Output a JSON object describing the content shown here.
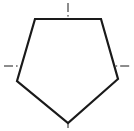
{
  "canvas": {
    "width": 134,
    "height": 131,
    "background_color": "#ffffff"
  },
  "figure": {
    "name": "pentagon",
    "label": "",
    "outline_color": "#1a1a1a",
    "outline_width": 2.2,
    "fill_color": "#ffffff",
    "vertices": [
      {
        "name": "top-left",
        "x": 35,
        "y": 19
      },
      {
        "name": "top-right",
        "x": 101,
        "y": 19
      },
      {
        "name": "right",
        "x": 118,
        "y": 79
      },
      {
        "name": "bottom",
        "x": 68,
        "y": 123
      },
      {
        "name": "left",
        "x": 17,
        "y": 81
      }
    ],
    "points_path": "35,19 101,19 118,79 68,123 17,81"
  },
  "centerlines": {
    "color": "#1a1a1a",
    "width": 1,
    "dash_pattern": "9 3 1.6 3",
    "vertical": {
      "name": "vertical-centerline",
      "x1": 68,
      "y1": 3,
      "x2": 68,
      "y2": 128
    },
    "horizontal": {
      "name": "horizontal-centerline",
      "x1": 4,
      "y1": 66,
      "x2": 130,
      "y2": 66
    }
  },
  "chart_data": {
    "type": "scatter",
    "xlabel": "",
    "ylabel": "",
    "xlim": [
      0,
      134
    ],
    "ylim": [
      0,
      131
    ],
    "grid": false,
    "legend": "none",
    "series": [
      {
        "name": "pentagon-outline",
        "x": [
          35,
          101,
          118,
          68,
          17,
          35
        ],
        "y": [
          19,
          19,
          79,
          123,
          81,
          19
        ]
      },
      {
        "name": "vertical-centerline",
        "x": [
          68,
          68
        ],
        "y": [
          3,
          128
        ]
      },
      {
        "name": "horizontal-centerline",
        "x": [
          4,
          130
        ],
        "y": [
          66,
          66
        ]
      }
    ],
    "annotations": []
  }
}
